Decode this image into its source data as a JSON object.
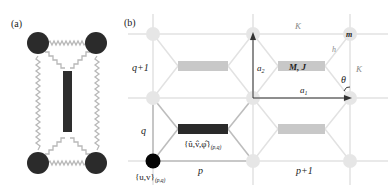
{
  "panel_a": {
    "label": "(a)",
    "description": "Four masses connected by springs with central rigid bar",
    "mass_color": "#2b2b2b",
    "bar_color": "#2e2e2e",
    "spring_color": "#b8b8b8"
  },
  "panel_b": {
    "label": "(b)",
    "row_labels": {
      "upper": "q+1",
      "lower": "q"
    },
    "col_labels": {
      "left": "p",
      "right": "p+1"
    },
    "vectors": {
      "a1": "a",
      "a1_sub": "1",
      "a2": "a",
      "a2_sub": "2"
    },
    "spring_labels": {
      "horizontal": "K",
      "vertical": "K",
      "diagonal": "h"
    },
    "mass_label": "m",
    "angle_label": "θ",
    "element_label": "M, J",
    "node_dof_label": "{u,v}",
    "node_dof_sub": "(p,q)",
    "element_dof_label": "{û,v̂,φ̂}",
    "element_dof_sub": "(p,q)",
    "colors": {
      "grid": "#e2e2e2",
      "node_light": "#e6e6e6",
      "node_dark": "#050505",
      "element_dark": "#2a2a2a",
      "element_light": "#c8c8c8",
      "diag_dark": "#bdbdbd",
      "vector": "#333333"
    }
  }
}
